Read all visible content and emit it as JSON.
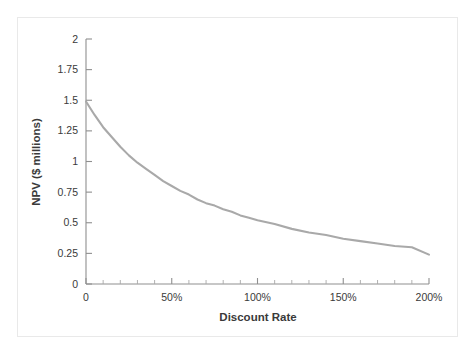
{
  "figure": {
    "background_color": "#ffffff",
    "frame_border_color": "#e9e9e9"
  },
  "chart_data": {
    "type": "line",
    "title": "",
    "subtitle": "",
    "xlabel": "Discount Rate",
    "ylabel": "NPV ($ millions)",
    "xlim": [
      0,
      200
    ],
    "ylim": [
      0,
      2
    ],
    "grid": false,
    "legend": null,
    "legend_position": "none",
    "line_color": "#a9a9a9",
    "axis_color": "#8f8f8f",
    "x_tick_labels": [
      "0",
      "50%",
      "100%",
      "150%",
      "200%"
    ],
    "x_tick_values": [
      0,
      50,
      100,
      150,
      200
    ],
    "x_minor_tick_interval": 10,
    "y_tick_labels": [
      "0",
      "0.25",
      "0.5",
      "0.75",
      "1",
      "1.25",
      "1.5",
      "1.75",
      "2"
    ],
    "y_tick_values": [
      0,
      0.25,
      0.5,
      0.75,
      1,
      1.25,
      1.5,
      1.75,
      2
    ],
    "series": [
      {
        "name": "NPV",
        "x": [
          0,
          5,
          10,
          15,
          20,
          25,
          30,
          35,
          40,
          45,
          50,
          55,
          60,
          65,
          70,
          75,
          80,
          85,
          90,
          95,
          100,
          110,
          120,
          130,
          140,
          150,
          160,
          170,
          180,
          190,
          200
        ],
        "values": [
          1.49,
          1.38,
          1.28,
          1.2,
          1.12,
          1.05,
          0.99,
          0.94,
          0.89,
          0.84,
          0.8,
          0.76,
          0.73,
          0.69,
          0.66,
          0.64,
          0.61,
          0.59,
          0.56,
          0.54,
          0.52,
          0.49,
          0.45,
          0.42,
          0.4,
          0.37,
          0.35,
          0.33,
          0.31,
          0.3,
          0.24
        ]
      }
    ]
  }
}
